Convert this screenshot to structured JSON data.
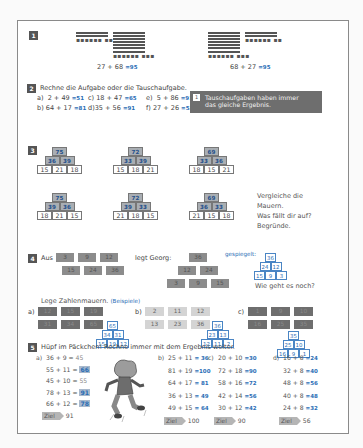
{
  "exercise1": {
    "number": "1",
    "left_equation": "27 + 68",
    "left_answer": "=95",
    "right_equation": "68 + 27",
    "right_answer": "=95"
  },
  "exercise2": {
    "number": "2",
    "instruction": "Rechne die Aufgabe oder die Tauschaufgabe.",
    "tasks": [
      {
        "label": "a)",
        "expr": "2 + 49",
        "answer": "=51"
      },
      {
        "label": "c)",
        "expr": "18 + 47",
        "answer": "=65"
      },
      {
        "label": "e)",
        "expr": "5 + 86",
        "answer": "=91"
      },
      {
        "label": "b)",
        "expr": "64 + 17",
        "answer": "=81"
      },
      {
        "label": "d)",
        "expr": "35 + 56",
        "answer": "=91"
      },
      {
        "label": "f)",
        "expr": "27 + 26",
        "answer": "=53"
      }
    ],
    "tip": {
      "number": "1",
      "line1": "Tauschaufgaben haben immer",
      "line2": "das gleiche Ergebnis."
    }
  },
  "exercise3": {
    "number": "3",
    "pyramids": [
      {
        "top": "75",
        "mid": [
          "36",
          "39"
        ],
        "base": [
          "15",
          "21",
          "18"
        ]
      },
      {
        "top": "72",
        "mid": [
          "33",
          "39"
        ],
        "base": [
          "15",
          "18",
          "21"
        ]
      },
      {
        "top": "69",
        "mid": [
          "33",
          "36"
        ],
        "base": [
          "18",
          "15",
          "21"
        ]
      },
      {
        "top": "75",
        "mid": [
          "39",
          "36"
        ],
        "base": [
          "18",
          "21",
          "15"
        ]
      },
      {
        "top": "72",
        "mid": [
          "39",
          "33"
        ],
        "base": [
          "21",
          "18",
          "15"
        ]
      },
      {
        "top": "69",
        "mid": [
          "36",
          "33"
        ],
        "base": [
          "21",
          "15",
          "18"
        ]
      }
    ],
    "question": [
      "Vergleiche die",
      "Mauern.",
      "Was fällt dir auf?",
      "Begründe."
    ]
  },
  "exercise4": {
    "number": "4",
    "aus_label": "Aus",
    "aus_row1": [
      "3",
      "9",
      "12"
    ],
    "aus_row2": [
      "15",
      "24",
      "36"
    ],
    "legt_label": "legt Georg:",
    "georg": {
      "top": "36",
      "mid": [
        "12",
        "24"
      ],
      "base": [
        "3",
        "9",
        "15"
      ]
    },
    "gespiegelt_label": "gespiegelt:",
    "mirrored": {
      "top": "36",
      "mid": [
        "24",
        "12"
      ],
      "base": [
        "15",
        "9",
        "3"
      ]
    },
    "question": "Wie geht es noch?",
    "lege_label": "Lege Zahlenmauern.",
    "beispiele_label": "(Beispiele)",
    "sets": [
      {
        "label": "a)",
        "row1": [
          "12",
          "15",
          "19"
        ],
        "row2": [
          "31",
          "34",
          "65"
        ],
        "solution": {
          "top": "65",
          "mid": [
            "34",
            "31"
          ],
          "base": [
            "15",
            "19",
            "12"
          ]
        }
      },
      {
        "label": "b)",
        "row1": [
          "2",
          "11",
          "12"
        ],
        "row2": [
          "13",
          "23",
          "36"
        ],
        "solution": {
          "top": "36",
          "mid": [
            "23",
            "13"
          ],
          "base": [
            "12",
            "11",
            "2"
          ]
        }
      },
      {
        "label": "c)",
        "row1": [
          "1",
          "9",
          "10"
        ],
        "row2": [
          "16",
          "25",
          "35"
        ],
        "solution": {
          "top": "35",
          "mid": [
            "25",
            "10"
          ],
          "base": [
            "16",
            "9",
            "1"
          ]
        }
      }
    ]
  },
  "exercise5": {
    "number": "5",
    "instruction": "Hüpf im Päckchen! Rechne immer mit dem Ergebnis weiter.",
    "ziel_label": "Ziel",
    "columns": [
      {
        "label": "a)",
        "rows": [
          {
            "expr": "36 +  9 = ",
            "answer": "45",
            "style": "plain"
          },
          {
            "expr": "55 + 11 = ",
            "answer": "66",
            "style": "hl"
          },
          {
            "expr": "45 + 10 = ",
            "answer": "55",
            "style": "plain"
          },
          {
            "expr": "78 + 13 = ",
            "answer": "91",
            "style": "hl"
          },
          {
            "expr": "66 + 12 = ",
            "answer": "78",
            "style": "hl"
          }
        ],
        "ziel": "91"
      },
      {
        "label": "b)",
        "rows": [
          {
            "expr": "25 +  11 ",
            "answer": "= 36"
          },
          {
            "expr": "81 +  19 ",
            "answer": "=100"
          },
          {
            "expr": "64 +  17 ",
            "answer": "= 81"
          },
          {
            "expr": "36 +  13 ",
            "answer": "= 49"
          },
          {
            "expr": "49 +  15 ",
            "answer": "= 64"
          }
        ],
        "ziel": "100"
      },
      {
        "label": "c)",
        "rows": [
          {
            "expr": "20 + 10 ",
            "answer": "=30"
          },
          {
            "expr": "72 + 18 ",
            "answer": "=90"
          },
          {
            "expr": "58 + 16 ",
            "answer": "=72"
          },
          {
            "expr": "42 + 14 ",
            "answer": "=56"
          },
          {
            "expr": "30 + 12 ",
            "answer": "=42"
          }
        ],
        "ziel": "90"
      },
      {
        "label": "d)",
        "rows": [
          {
            "expr": "16 +  8 ",
            "answer": "=24"
          },
          {
            "expr": "32 +  8 ",
            "answer": "=40"
          },
          {
            "expr": "48 +  8 ",
            "answer": "=56"
          },
          {
            "expr": "40 +  8 ",
            "answer": "=48"
          },
          {
            "expr": "24 +  8 ",
            "answer": "=32"
          }
        ],
        "ziel": "56"
      }
    ]
  },
  "colors": {
    "answer_blue": "#2a6db5",
    "tip_bg": "#6e6e6e",
    "pyramid_gray": "#a9aeb3"
  }
}
